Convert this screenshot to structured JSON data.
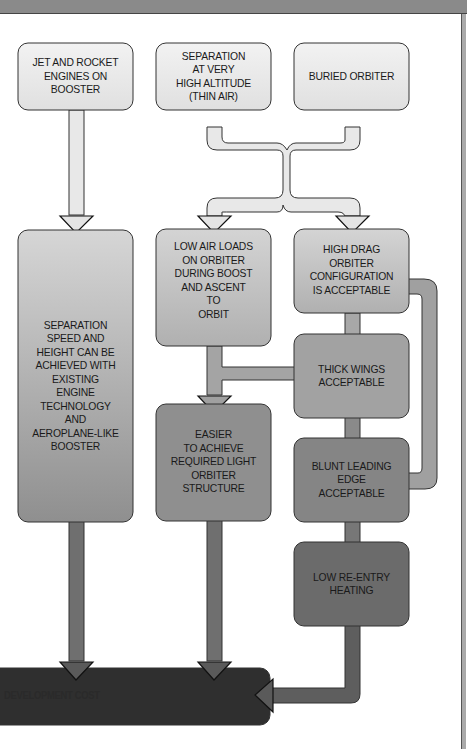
{
  "diagram": {
    "type": "flowchart",
    "nodes": {
      "jet_rocket": {
        "label": "JET AND ROCKET\nENGINES ON\nBOOSTER",
        "shade": "#e6e6e6"
      },
      "separation_altitude": {
        "label": "SEPARATION\nAT VERY\nHIGH ALTITUDE\n(THIN AIR)",
        "shade": "#e6e6e6"
      },
      "buried_orbiter": {
        "label": "BURIED ORBITER",
        "shade": "#e6e6e6"
      },
      "separation_speed": {
        "label": "SEPARATION\nSPEED AND\nHEIGHT CAN BE\nACHIEVED WITH\nEXISTING\nENGINE\nTECHNOLOGY\nAND\nAEROPLANE-LIKE\nBOOSTER",
        "shade": "#a8a8a8"
      },
      "low_air_loads": {
        "label": "LOW AIR LOADS\nON ORBITER\nDURING BOOST\nAND ASCENT\nTO\nORBIT",
        "shade": "#bdbdbd"
      },
      "high_drag": {
        "label": "HIGH DRAG\nORBITER\nCONFIGURATION\nIS ACCEPTABLE",
        "shade": "#bdbdbd"
      },
      "thick_wings": {
        "label": "THICK WINGS\nACCEPTABLE",
        "shade": "#9a9a9a"
      },
      "easier_structure": {
        "label": "EASIER\nTO ACHIEVE\nREQUIRED LIGHT\nORBITER\nSTRUCTURE",
        "shade": "#8e8e8e"
      },
      "blunt_edge": {
        "label": "BLUNT LEADING\nEDGE\nACCEPTABLE",
        "shade": "#808080"
      },
      "low_reentry": {
        "label": "LOW RE-ENTRY\nHEATING",
        "shade": "#6e6e6e"
      },
      "dev_cost": {
        "label": "DEVELOPMENT COST",
        "shade": "#2e2e2e"
      }
    },
    "edges": [
      {
        "from": "jet_rocket",
        "to": "separation_speed"
      },
      {
        "from": "separation_altitude",
        "to": "low_air_loads"
      },
      {
        "from": "separation_altitude",
        "to": "high_drag"
      },
      {
        "from": "buried_orbiter",
        "to": "low_air_loads"
      },
      {
        "from": "buried_orbiter",
        "to": "high_drag"
      },
      {
        "from": "low_air_loads",
        "to": "easier_structure"
      },
      {
        "from": "high_drag",
        "to": "thick_wings"
      },
      {
        "from": "high_drag",
        "to": "blunt_edge"
      },
      {
        "from": "thick_wings",
        "to": "easier_structure"
      },
      {
        "from": "thick_wings",
        "to": "blunt_edge"
      },
      {
        "from": "blunt_edge",
        "to": "low_reentry"
      },
      {
        "from": "separation_speed",
        "to": "dev_cost"
      },
      {
        "from": "easier_structure",
        "to": "dev_cost"
      },
      {
        "from": "low_reentry",
        "to": "dev_cost"
      }
    ]
  }
}
